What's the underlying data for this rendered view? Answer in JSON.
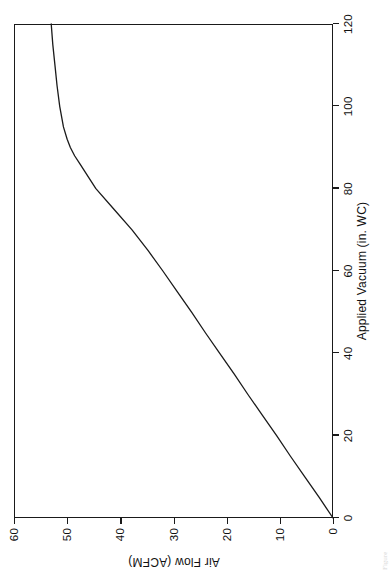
{
  "figure": {
    "orientation": "rotated-90-ccw",
    "background_color": "#ffffff",
    "line_color": "#1a1a1a",
    "caption_fragment": "Figure"
  },
  "chart_data": {
    "type": "line",
    "title": "",
    "subtitle": "",
    "xlabel": "Applied Vacuum (in. WC)",
    "ylabel": "Air Flow (ACFM)",
    "xlim": [
      0,
      120
    ],
    "ylim": [
      0,
      60
    ],
    "xticks": [
      0,
      20,
      40,
      60,
      80,
      100,
      120
    ],
    "yticks": [
      0,
      10,
      20,
      30,
      40,
      50,
      60
    ],
    "xtick_labels": [
      "0",
      "20",
      "40",
      "60",
      "80",
      "100",
      "120"
    ],
    "ytick_labels": [
      "0",
      "10",
      "20",
      "30",
      "40",
      "50",
      "60"
    ],
    "grid": false,
    "legend": false,
    "legend_position": "none",
    "series": [
      {
        "name": "Air Flow vs Applied Vacuum",
        "color": "#1a1a1a",
        "x": [
          0,
          5,
          10,
          15,
          20,
          25,
          30,
          35,
          40,
          45,
          50,
          55,
          60,
          65,
          70,
          75,
          80,
          82,
          84,
          86,
          88,
          90,
          92,
          95,
          100,
          105,
          110,
          115,
          120
        ],
        "y": [
          0,
          2.6,
          5.3,
          8.0,
          10.6,
          13.3,
          16.0,
          18.6,
          21.3,
          24.0,
          26.6,
          29.3,
          32.0,
          34.8,
          37.8,
          41.2,
          44.6,
          45.6,
          46.6,
          47.6,
          48.6,
          49.4,
          50.0,
          50.7,
          51.4,
          51.9,
          52.3,
          52.7,
          53.0
        ]
      }
    ],
    "annotations": []
  }
}
